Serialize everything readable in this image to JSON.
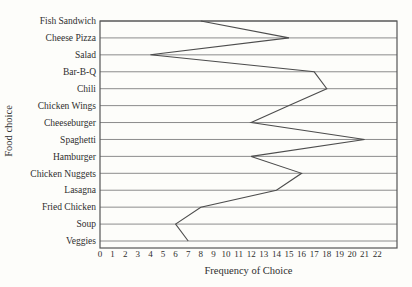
{
  "page": {
    "background": "#fdfdfa"
  },
  "chart_data": {
    "type": "line",
    "orientation": "categories-on-y-axis",
    "title": "",
    "xlabel": "Frequency of Choice",
    "ylabel": "Food choice",
    "categories": [
      "Fish Sandwich",
      "Cheese Pizza",
      "Salad",
      "Bar-B-Q",
      "Chili",
      "Chicken Wings",
      "Cheeseburger",
      "Spaghetti",
      "Hamburger",
      "Chicken Nuggets",
      "Lasagna",
      "Fried Chicken",
      "Soup",
      "Veggies"
    ],
    "values": [
      8,
      15,
      4,
      17,
      18,
      15,
      12,
      21,
      12,
      16,
      14,
      8,
      6,
      7
    ],
    "xlim": [
      0,
      22
    ],
    "xticks": [
      0,
      1,
      2,
      3,
      4,
      5,
      6,
      7,
      8,
      9,
      10,
      11,
      12,
      13,
      14,
      15,
      16,
      17,
      18,
      19,
      20,
      21,
      22
    ],
    "grid": "horizontal",
    "legend": "none",
    "colors": {
      "line": "#4d4d4d",
      "grid": "#8c8c8c",
      "border": "#555555",
      "text": "#2e2e2e"
    }
  }
}
